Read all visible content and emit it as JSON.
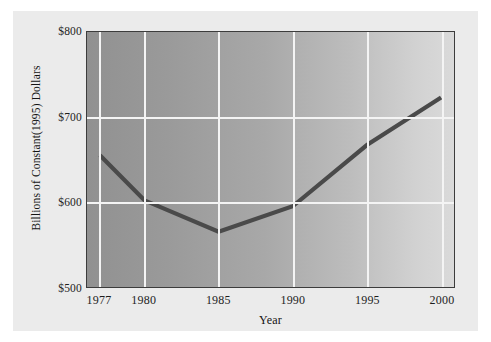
{
  "chart_data": {
    "type": "line",
    "title": "",
    "xlabel": "Year",
    "ylabel": "Billions of Constant(1995) Dollars",
    "x": [
      1977,
      1980,
      1985,
      1990,
      1995,
      2000
    ],
    "values": [
      655,
      602,
      565,
      595,
      667,
      723
    ],
    "series": [
      {
        "name": "",
        "values": [
          655,
          602,
          565,
          595,
          667,
          723
        ]
      }
    ],
    "xtick_labels": [
      "1977",
      "1980",
      "1985",
      "1990",
      "1995",
      "2000"
    ],
    "ytick_labels": [
      "$800",
      "$700",
      "$600",
      "$500"
    ],
    "ytick_values": [
      800,
      700,
      600,
      500
    ],
    "xlim": [
      1977,
      2000
    ],
    "ylim": [
      500,
      800
    ],
    "grid": true,
    "grid_color": "#f4f4f4",
    "legend": false,
    "line_color": "#4a4a4a",
    "plot_background": "#a8a8a8",
    "panel_background": "#ebebeb"
  },
  "axes": {
    "y_title": "Billions of Constant(1995) Dollars",
    "x_title": "Year",
    "y_ticks": [
      {
        "label": "$800",
        "value": 800
      },
      {
        "label": "$700",
        "value": 700
      },
      {
        "label": "$600",
        "value": 600
      },
      {
        "label": "$500",
        "value": 500
      }
    ],
    "x_ticks": [
      {
        "label": "1977",
        "value": 1977
      },
      {
        "label": "1980",
        "value": 1980
      },
      {
        "label": "1985",
        "value": 1985
      },
      {
        "label": "1990",
        "value": 1990
      },
      {
        "label": "1995",
        "value": 1995
      },
      {
        "label": "2000",
        "value": 2000
      }
    ]
  }
}
